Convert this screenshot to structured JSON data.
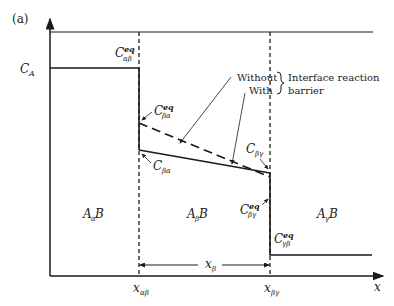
{
  "figure": {
    "panel_label": "(a)",
    "axis": {
      "x_label": "x"
    },
    "legend": {
      "without": "Without",
      "with": "With",
      "group_label_line1": "Interface reaction",
      "group_label_line2": "barrier"
    },
    "concentrations": {
      "c_a": {
        "main": "C",
        "sub": "A"
      },
      "c_ab_eq": {
        "main": "C",
        "sup": "eq",
        "sub": "αβ"
      },
      "c_ba_eq": {
        "main": "C",
        "sup": "eq",
        "sub": "βα"
      },
      "c_ba": {
        "main": "C",
        "sub": "βα"
      },
      "c_bg": {
        "main": "C",
        "sub": "βγ"
      },
      "c_bg_eq": {
        "main": "C",
        "sup": "eq",
        "sub": "βγ"
      },
      "c_gb_eq": {
        "main": "C",
        "sup": "eq",
        "sub": "γβ"
      }
    },
    "phases": [
      {
        "main": "A",
        "sub": "α",
        "tail": "B"
      },
      {
        "main": "A",
        "sub": "β",
        "tail": "B"
      },
      {
        "main": "A",
        "sub": "γ",
        "tail": "B"
      }
    ],
    "positions": {
      "x_ab": {
        "main": "x",
        "sub": "αβ"
      },
      "x_bg": {
        "main": "x",
        "sub": "βγ"
      },
      "x_b": {
        "main": "x",
        "sub": "β"
      }
    },
    "colors": {
      "ink": "#1a1a1a",
      "background": "#ffffff"
    }
  }
}
